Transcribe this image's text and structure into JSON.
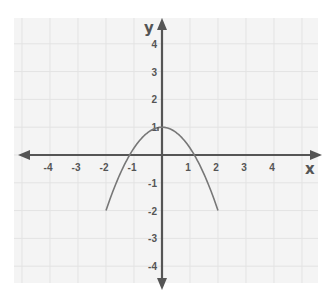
{
  "chart_data": {
    "type": "line",
    "title": "",
    "xlabel": "x",
    "ylabel": "y",
    "xlim": [
      -5,
      5
    ],
    "ylim": [
      -4.4,
      4.6
    ],
    "grid": true,
    "x_ticks": [
      -4,
      -3,
      -2,
      -1,
      1,
      2,
      3,
      4
    ],
    "y_ticks": [
      4,
      3,
      2,
      1,
      -1,
      -2,
      -3,
      -4
    ],
    "x_tick_labels": [
      "-4",
      "-3",
      "-2",
      "-1",
      "1",
      "2",
      "3",
      "4"
    ],
    "y_tick_labels": [
      "4",
      "3",
      "2",
      "1",
      "-1",
      "-2",
      "-3",
      "-4"
    ],
    "series": [
      {
        "name": "parabola",
        "equation": "y = 1 - 0.75x^2",
        "x": [
          -2,
          -1.5,
          -1,
          -0.5,
          0,
          0.5,
          1,
          1.5,
          2
        ],
        "y": [
          -2,
          -0.69,
          0.25,
          0.81,
          1,
          0.81,
          0.25,
          -0.69,
          -2
        ]
      }
    ],
    "legend": null
  },
  "colors": {
    "axis": "#555555",
    "curve": "#777777",
    "grid": "#e3e3e3",
    "background": "#f4f4f4"
  },
  "labels": {
    "x_axis": "x",
    "y_axis": "y"
  }
}
